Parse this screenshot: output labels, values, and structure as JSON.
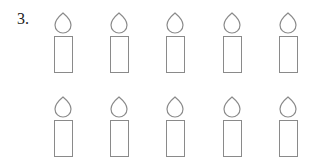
{
  "problem": {
    "number": "3."
  },
  "candles": {
    "rows": 2,
    "per_row": 5,
    "count": 10,
    "stroke_color": "#8a8a8a"
  }
}
